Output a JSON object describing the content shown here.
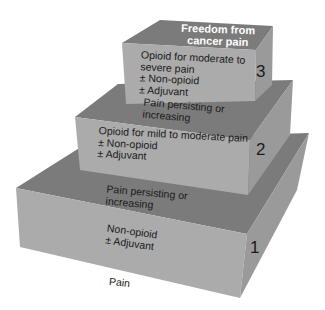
{
  "diagram": {
    "colors": {
      "top_face": "#7b7b7b",
      "front_face": "#ababab",
      "right_face": "#9a9a9a",
      "text": "#1a1a1a",
      "title_text": "#ffffff"
    },
    "goal": {
      "line1": "Freedom from",
      "line2": "cancer pain"
    },
    "start_label": "Pain",
    "steps": [
      {
        "number": "1",
        "lines": [
          "Non-opioid",
          "± Adjuvant"
        ]
      },
      {
        "number": "2",
        "lines": [
          "Opioid for mild to moderate pain",
          "± Non-opioid",
          "± Adjuvant"
        ]
      },
      {
        "number": "3",
        "lines": [
          "Opioid for moderate to",
          "severe pain",
          "± Non-opioid",
          "± Adjuvant"
        ]
      }
    ],
    "transitions": [
      {
        "lines": [
          "Pain persisting or",
          "increasing"
        ]
      },
      {
        "lines": [
          "Pain persisting or",
          "increasing"
        ]
      }
    ]
  }
}
